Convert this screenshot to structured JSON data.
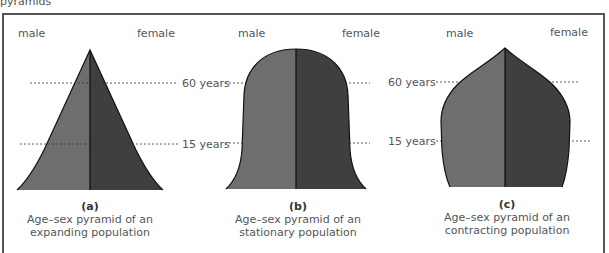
{
  "header": {
    "caption": "pyramids"
  },
  "labels": {
    "male": "male",
    "female": "female",
    "age_60": "60 years",
    "age_15": "15 years"
  },
  "pyramids": [
    {
      "id": "a",
      "letter": "(a)",
      "line1": "Age–sex pyramid of an",
      "line2": "expanding population"
    },
    {
      "id": "b",
      "letter": "(b)",
      "line1": "Age–sex pyramid of an",
      "line2": "stationary population"
    },
    {
      "id": "c",
      "letter": "(c)",
      "line1": "Age–sex pyramid of an",
      "line2": "contracting population"
    }
  ],
  "colors": {
    "male_fill": "#6e6e6e",
    "female_fill": "#3f3f3f",
    "outline": "#111111",
    "frame": "#555555"
  }
}
